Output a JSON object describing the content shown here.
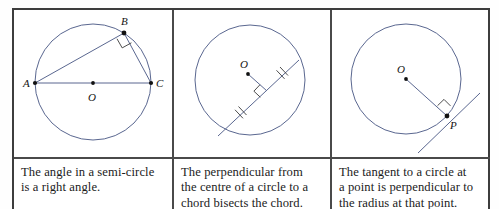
{
  "figure": {
    "type": "geometry-diagram-table",
    "columns": 3,
    "stroke_color": "#5a6790",
    "border_color": "#3d3d3d",
    "text_color": "#1b1b1b",
    "background": "#ffffff"
  },
  "panels": [
    {
      "id": "semicircle-angle",
      "labels": {
        "A": "A",
        "B": "B",
        "C": "C",
        "O": "O"
      },
      "geometry": {
        "circle": {
          "cx": 79,
          "cy": 72,
          "r": 58
        },
        "points": {
          "A": {
            "x": 21,
            "y": 73
          },
          "B": {
            "x": 110,
            "y": 23
          },
          "C": {
            "x": 137,
            "y": 73
          },
          "O": {
            "x": 79,
            "y": 73
          }
        },
        "segments": [
          {
            "from": "A",
            "to": "C",
            "note": "diameter"
          },
          {
            "from": "A",
            "to": "B",
            "note": "chord"
          },
          {
            "from": "B",
            "to": "C",
            "note": "chord"
          }
        ],
        "right_angle_at": "B"
      },
      "caption_lines": [
        "The angle in a semi-circle",
        "is a right angle."
      ]
    },
    {
      "id": "perpendicular-bisects-chord",
      "labels": {
        "O": "O"
      },
      "geometry": {
        "circle": {
          "cx": 76,
          "cy": 70,
          "r": 55
        },
        "points": {
          "O": {
            "x": 74,
            "y": 64
          },
          "chord_start": {
            "x": 46,
            "y": 124
          },
          "chord_end": {
            "x": 123,
            "y": 52
          },
          "foot": {
            "x": 93,
            "y": 80
          }
        },
        "segments": [
          {
            "from": "chord_start",
            "to": "chord_end",
            "note": "chord"
          },
          {
            "from": "O",
            "to": "foot",
            "note": "perpendicular from centre"
          }
        ],
        "right_angle_at": "foot",
        "tick_marks": 2,
        "tick_note": "equal halves of the chord"
      },
      "caption_lines": [
        "The perpendicular from",
        "the centre of a circle to a",
        "chord bisects the chord."
      ]
    },
    {
      "id": "tangent-perpendicular-radius",
      "labels": {
        "O": "O",
        "P": "P"
      },
      "geometry": {
        "circle": {
          "cx": 74,
          "cy": 69,
          "r": 55
        },
        "points": {
          "O": {
            "x": 74,
            "y": 69
          },
          "P": {
            "x": 115,
            "y": 106
          }
        },
        "segments": [
          {
            "from": "O",
            "to": "P",
            "note": "radius"
          },
          {
            "from": "tangent_start",
            "to": "tangent_end",
            "note": "tangent through P"
          }
        ],
        "tangent": {
          "start": {
            "x": 88,
            "y": 141
          },
          "end": {
            "x": 146,
            "y": 85
          }
        },
        "right_angle_at": "P"
      },
      "caption_lines": [
        "The tangent to a circle at",
        "a point is perpendicular to",
        "the radius at that point."
      ]
    }
  ]
}
